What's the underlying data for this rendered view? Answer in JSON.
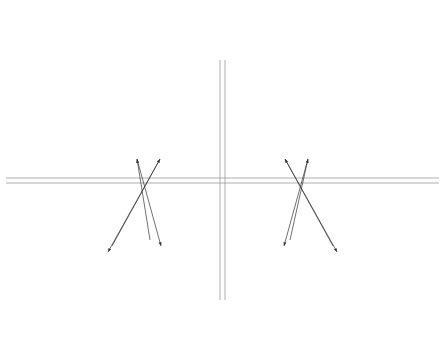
{
  "upper": {
    "organs": [
      {
        "id": "u1",
        "lines": [
          "Herz",
          "Dünndarm"
        ]
      },
      {
        "id": "u2",
        "lines": [
          "Pankreas",
          "Magen"
        ]
      },
      {
        "id": "u3",
        "lines": [
          "Lunge",
          "Dickdarm"
        ]
      },
      {
        "id": "u4",
        "lines": [
          "Leber",
          "Gallenbl."
        ]
      },
      {
        "id": "u5a",
        "lines": [
          "Niere",
          "Blase"
        ]
      },
      {
        "id": "u5b",
        "lines": [
          "Niere",
          "Blase"
        ]
      },
      {
        "id": "u6",
        "lines": [
          "Leber",
          "Gallenbl."
        ]
      },
      {
        "id": "u7",
        "lines": [
          "Lunge",
          "Dickdarm"
        ]
      },
      {
        "id": "u8",
        "lines": [
          "Pankreas",
          "Magen"
        ]
      },
      {
        "id": "u9",
        "lines": [
          "Herz",
          "Dünndarm"
        ]
      }
    ],
    "symptoms": [
      {
        "id": "us1",
        "lines": [
          "Duodenum",
          "Mittelohr",
          "Schulter",
          "Ellbogen",
          "ZNS"
        ]
      },
      {
        "id": "us2",
        "lines": [
          "Oropharynx",
          "Sinus max.",
          "Larynx"
        ]
      },
      {
        "id": "us3",
        "lines": [
          "Nase Neben-",
          "höhlen",
          "Sinus ethm.",
          "Bronchien"
        ]
      },
      {
        "id": "us4",
        "lines": [
          "Auge",
          "Sinus",
          "sphen.",
          "Tonsilla",
          "pal.",
          "Hüfte",
          "Knie"
        ]
      },
      {
        "id": "us5",
        "lines": [
          "Urogenital-",
          "System",
          "Ohr",
          "Sinus front.",
          "Tonsilla phar."
        ]
      },
      {
        "id": "us6",
        "lines": [
          "Auge",
          "Sinus",
          "sphen.",
          "Tonsilla",
          "pal.",
          "Hüfte",
          "Knie"
        ]
      },
      {
        "id": "us7",
        "lines": [
          "Nase Neben-",
          "höhlen",
          "Sinus ethm.",
          "Bronchien"
        ]
      },
      {
        "id": "us8",
        "lines": [
          "Oropharynx",
          "Sinus max.",
          "Larynx"
        ]
      },
      {
        "id": "us9",
        "lines": [
          "Ileum",
          "Jejunum",
          "Mittelohr",
          "Schulter",
          "Ellbogen",
          "ZNS"
        ]
      }
    ],
    "teeth_left": [
      "18",
      "17",
      "16",
      "15",
      "14",
      "13",
      "12",
      "11"
    ],
    "teeth_right": [
      "21",
      "22",
      "23",
      "24",
      "25",
      "26",
      "27",
      "28"
    ],
    "points_left": [
      "0 19",
      "0 18",
      "0 17",
      "0 16",
      "0 15",
      "0 14",
      "0 13",
      "0 12",
      "0 11"
    ],
    "points_right": [
      "0 21",
      "0 22",
      "0 23",
      "0 24",
      "0 25",
      "0 26",
      "0 27",
      "0 28",
      "0 29"
    ]
  },
  "lower": {
    "organs": [
      {
        "id": "l1",
        "lines": [
          "Herz",
          "Dünndarm"
        ]
      },
      {
        "id": "l2",
        "lines": [
          "Lunge",
          "Dickdarm"
        ]
      },
      {
        "id": "l3",
        "lines": [
          "Pankreas",
          "Magen"
        ]
      },
      {
        "id": "l4",
        "lines": [
          "Leber",
          "Gallenbl."
        ]
      },
      {
        "id": "l5a",
        "lines": [
          "Niere",
          "Blase"
        ]
      },
      {
        "id": "l5b",
        "lines": [
          "Niere",
          "Blase"
        ]
      },
      {
        "id": "l6",
        "lines": [
          "Leber",
          "Gallenbl."
        ]
      },
      {
        "id": "l7",
        "lines": [
          "Milz",
          "Magen"
        ]
      },
      {
        "id": "l8",
        "lines": [
          "Lunge",
          "Dickdarm"
        ]
      },
      {
        "id": "l9",
        "lines": [
          "Herz",
          "Dünndarm"
        ]
      }
    ],
    "symptoms": [
      {
        "id": "ls1",
        "lines": [
          "Schulter",
          "Ellbogen",
          "Ileum",
          "Mittelohr",
          "Periph. Nerven"
        ]
      },
      {
        "id": "ls2",
        "lines": [
          "Nase Neben-",
          "höhlen",
          "Sinus ethm.",
          "Bronchien"
        ]
      },
      {
        "id": "ls3",
        "lines": [
          "Lymph.",
          "gefäße",
          "Mammadr.",
          "Oropharynx",
          "Sinus max.",
          "Larynx"
        ]
      },
      {
        "id": "ls4",
        "lines": [
          "Hüfte",
          "Knie",
          "Auge",
          "Sinus",
          "sphen.",
          "Tonsilla pal."
        ]
      },
      {
        "id": "ls5",
        "lines": [
          "Urogenital-",
          "System",
          "Ohr",
          "Sinus front.",
          "Tonsilla phar."
        ]
      },
      {
        "id": "ls6",
        "lines": [
          "Hüfte",
          "Knie",
          "Auge",
          "Sinus",
          "sphen.",
          "Tonsilla pal."
        ]
      },
      {
        "id": "ls7",
        "lines": [
          "Lymph.",
          "gefäße",
          "Mammadr.",
          "Oropharynx",
          "Sinus max.",
          "Larynx"
        ]
      },
      {
        "id": "ls8",
        "lines": [
          "Nase Neben-",
          "höhlen",
          "Sinus ethm.",
          "Bronchien"
        ]
      },
      {
        "id": "ls9",
        "lines": [
          "Schulter",
          "Ellbogen",
          "Ileum",
          "Jejunum",
          "Mittelohr",
          "Periph. Nerven"
        ]
      }
    ],
    "teeth_left": [
      "48",
      "47",
      "46",
      "45",
      "44",
      "43",
      "42",
      "41"
    ],
    "teeth_right": [
      "31",
      "32",
      "33",
      "34",
      "35",
      "36",
      "37",
      "38"
    ],
    "points_left": [
      "0 49",
      "0 48",
      "0 47",
      "0 46",
      "0 45",
      "0 44",
      "0 43",
      "0 42",
      "0 41"
    ],
    "points_right": [
      "0 31",
      "0 32",
      "0 33",
      "0 34",
      "0 35",
      "0 36",
      "0 37",
      "0 38",
      "0 39"
    ]
  },
  "colors": {
    "line": "#8a8a8a",
    "band_gray": "#d9d9d9",
    "text": "#333333",
    "dot": "#111111"
  }
}
